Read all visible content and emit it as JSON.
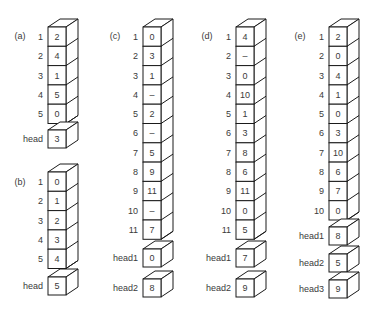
{
  "panels": [
    {
      "label": "(a)",
      "rows": [
        {
          "index": "1",
          "value": "2"
        },
        {
          "index": "2",
          "value": "4"
        },
        {
          "index": "3",
          "value": "1"
        },
        {
          "index": "4",
          "value": "5"
        },
        {
          "index": "5",
          "value": "0"
        }
      ],
      "heads": [
        {
          "label": "head",
          "value": "3"
        }
      ]
    },
    {
      "label": "(b)",
      "rows": [
        {
          "index": "1",
          "value": "0"
        },
        {
          "index": "2",
          "value": "1"
        },
        {
          "index": "3",
          "value": "2"
        },
        {
          "index": "4",
          "value": "3"
        },
        {
          "index": "5",
          "value": "4"
        }
      ],
      "heads": [
        {
          "label": "head",
          "value": "5"
        }
      ]
    },
    {
      "label": "(c)",
      "rows": [
        {
          "index": "1",
          "value": "0"
        },
        {
          "index": "2",
          "value": "3"
        },
        {
          "index": "3",
          "value": "1"
        },
        {
          "index": "4",
          "value": "–"
        },
        {
          "index": "5",
          "value": "2"
        },
        {
          "index": "6",
          "value": "–"
        },
        {
          "index": "7",
          "value": "5"
        },
        {
          "index": "8",
          "value": "9"
        },
        {
          "index": "9",
          "value": "11"
        },
        {
          "index": "10",
          "value": "–"
        },
        {
          "index": "11",
          "value": "7"
        }
      ],
      "heads": [
        {
          "label": "head1",
          "value": "0"
        },
        {
          "label": "head2",
          "value": "8"
        }
      ]
    },
    {
      "label": "(d)",
      "rows": [
        {
          "index": "1",
          "value": "4"
        },
        {
          "index": "2",
          "value": "–"
        },
        {
          "index": "3",
          "value": "0"
        },
        {
          "index": "4",
          "value": "10"
        },
        {
          "index": "5",
          "value": "1"
        },
        {
          "index": "6",
          "value": "3"
        },
        {
          "index": "7",
          "value": "8"
        },
        {
          "index": "8",
          "value": "6"
        },
        {
          "index": "9",
          "value": "11"
        },
        {
          "index": "10",
          "value": "0"
        },
        {
          "index": "11",
          "value": "5"
        }
      ],
      "heads": [
        {
          "label": "head1",
          "value": "7"
        },
        {
          "label": "head2",
          "value": "9"
        }
      ]
    },
    {
      "label": "(e)",
      "rows": [
        {
          "index": "1",
          "value": "2"
        },
        {
          "index": "2",
          "value": "0"
        },
        {
          "index": "3",
          "value": "4"
        },
        {
          "index": "4",
          "value": "1"
        },
        {
          "index": "5",
          "value": "0"
        },
        {
          "index": "6",
          "value": "3"
        },
        {
          "index": "7",
          "value": "10"
        },
        {
          "index": "8",
          "value": "6"
        },
        {
          "index": "9",
          "value": "7"
        },
        {
          "index": "10",
          "value": "0"
        }
      ],
      "heads": [
        {
          "label": "head1",
          "value": "8"
        },
        {
          "label": "head2",
          "value": "5"
        },
        {
          "label": "head3",
          "value": "9"
        }
      ]
    }
  ]
}
